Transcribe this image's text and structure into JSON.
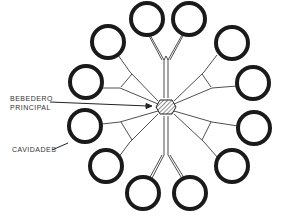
{
  "labels": {
    "sprue": [
      "BEBEDERO",
      "PRINCIPAL"
    ],
    "cavities": "CAVIDADES"
  },
  "diagram": {
    "center": [
      166,
      107
    ],
    "ring_count": 12,
    "ring_color": "#1a1a1a",
    "hub_hatch": true
  }
}
